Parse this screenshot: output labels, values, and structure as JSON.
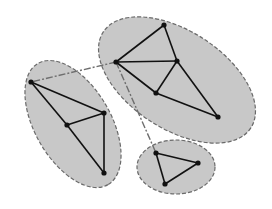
{
  "diagram": {
    "type": "clustered-graph",
    "colors": {
      "cluster_fill": "#c8c8c8",
      "cluster_stroke": "#6a6a6a",
      "edge": "#111111",
      "inter_cluster_link": "#6e6e6e",
      "node": "#111111"
    },
    "clusters": [
      {
        "id": "A",
        "ellipse": {
          "cx": 177,
          "cy": 80,
          "rx": 88,
          "ry": 49,
          "rotate": 33
        },
        "nodes": [
          {
            "id": "A1",
            "x": 116,
            "y": 62
          },
          {
            "id": "A2",
            "x": 164,
            "y": 25
          },
          {
            "id": "A3",
            "x": 177,
            "y": 61
          },
          {
            "id": "A4",
            "x": 156,
            "y": 93
          },
          {
            "id": "A5",
            "x": 218,
            "y": 117
          }
        ],
        "edges": [
          [
            "A1",
            "A2"
          ],
          [
            "A2",
            "A3"
          ],
          [
            "A1",
            "A3"
          ],
          [
            "A1",
            "A4"
          ],
          [
            "A3",
            "A4"
          ],
          [
            "A3",
            "A5"
          ],
          [
            "A4",
            "A5"
          ]
        ]
      },
      {
        "id": "B",
        "ellipse": {
          "cx": 73,
          "cy": 124,
          "rx": 70,
          "ry": 38,
          "rotate": 60
        },
        "nodes": [
          {
            "id": "B1",
            "x": 31,
            "y": 82
          },
          {
            "id": "B2",
            "x": 104,
            "y": 113
          },
          {
            "id": "B3",
            "x": 67,
            "y": 125
          },
          {
            "id": "B4",
            "x": 104,
            "y": 173
          }
        ],
        "edges": [
          [
            "B1",
            "B2"
          ],
          [
            "B1",
            "B3"
          ],
          [
            "B3",
            "B2"
          ],
          [
            "B2",
            "B4"
          ],
          [
            "B3",
            "B4"
          ]
        ]
      },
      {
        "id": "C",
        "ellipse": {
          "cx": 176,
          "cy": 167,
          "rx": 39,
          "ry": 27,
          "rotate": 0
        },
        "nodes": [
          {
            "id": "C1",
            "x": 156,
            "y": 153
          },
          {
            "id": "C2",
            "x": 198,
            "y": 163
          },
          {
            "id": "C3",
            "x": 165,
            "y": 184
          }
        ],
        "edges": [
          [
            "C1",
            "C2"
          ],
          [
            "C2",
            "C3"
          ],
          [
            "C1",
            "C3"
          ]
        ]
      }
    ],
    "inter_cluster_links": [
      [
        "A1",
        "B1"
      ],
      [
        "A1",
        "C1"
      ]
    ]
  }
}
